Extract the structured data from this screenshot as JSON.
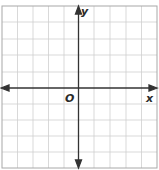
{
  "graph": {
    "x_label": "x",
    "y_label": "y",
    "origin_label": "O",
    "grid": {
      "columns": 10,
      "rows": 10
    },
    "colors": {
      "axis": "#333333",
      "grid": "#c8c8c8",
      "border": "#9a9a9a"
    }
  }
}
